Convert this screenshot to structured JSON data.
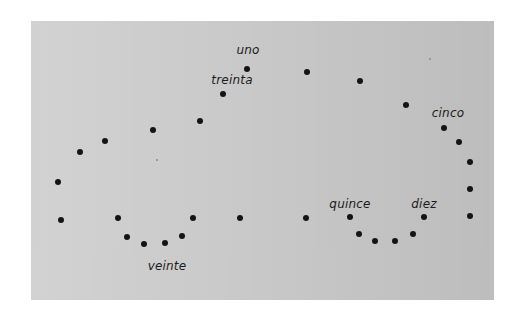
{
  "diagram": {
    "type": "connect-the-dots",
    "panel": {
      "background_light": "#d2d2d2",
      "background_dark": "#bdbdbd",
      "dot_color": "#141414"
    },
    "labels": [
      {
        "id": "uno",
        "text": "uno",
        "x": 248,
        "y": 50
      },
      {
        "id": "treinta",
        "text": "treinta",
        "x": 232,
        "y": 80
      },
      {
        "id": "cinco",
        "text": "cinco",
        "x": 448,
        "y": 113
      },
      {
        "id": "quince",
        "text": "quince",
        "x": 350,
        "y": 204
      },
      {
        "id": "diez",
        "text": "diez",
        "x": 424,
        "y": 204
      },
      {
        "id": "veinte",
        "text": "veinte",
        "x": 167,
        "y": 266
      }
    ],
    "dots": [
      {
        "x": 247,
        "y": 69
      },
      {
        "x": 307,
        "y": 72
      },
      {
        "x": 360,
        "y": 81
      },
      {
        "x": 406,
        "y": 105
      },
      {
        "x": 444,
        "y": 128
      },
      {
        "x": 459,
        "y": 142
      },
      {
        "x": 470,
        "y": 162
      },
      {
        "x": 470,
        "y": 189
      },
      {
        "x": 470,
        "y": 216
      },
      {
        "x": 424,
        "y": 217
      },
      {
        "x": 413,
        "y": 234
      },
      {
        "x": 395,
        "y": 241
      },
      {
        "x": 375,
        "y": 241
      },
      {
        "x": 359,
        "y": 234
      },
      {
        "x": 350,
        "y": 217
      },
      {
        "x": 306,
        "y": 218
      },
      {
        "x": 240,
        "y": 218
      },
      {
        "x": 193,
        "y": 218
      },
      {
        "x": 182,
        "y": 236
      },
      {
        "x": 165,
        "y": 243
      },
      {
        "x": 144,
        "y": 244
      },
      {
        "x": 127,
        "y": 237
      },
      {
        "x": 118,
        "y": 218
      },
      {
        "x": 61,
        "y": 220
      },
      {
        "x": 58,
        "y": 182
      },
      {
        "x": 80,
        "y": 152
      },
      {
        "x": 105,
        "y": 141
      },
      {
        "x": 153,
        "y": 130
      },
      {
        "x": 200,
        "y": 121
      },
      {
        "x": 223,
        "y": 94
      }
    ],
    "specks": [
      {
        "x": 429,
        "y": 58
      },
      {
        "x": 156,
        "y": 159
      }
    ]
  }
}
